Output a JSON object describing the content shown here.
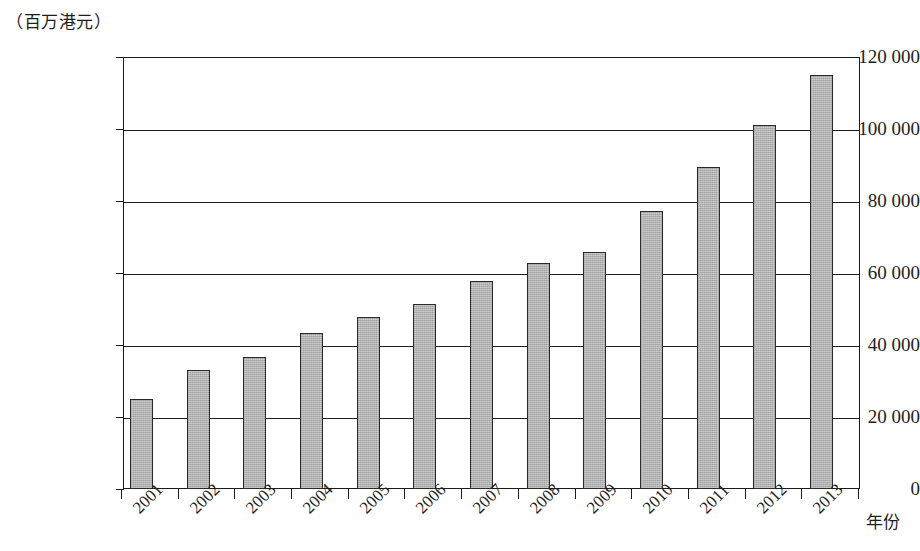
{
  "chart_data": {
    "type": "bar",
    "title": "",
    "subtitle": "",
    "unit_caption": "（百万港元）",
    "xlabel": "年份",
    "ylabel": "",
    "categories": [
      "2001",
      "2002",
      "2003",
      "2004",
      "2005",
      "2006",
      "2007",
      "2008",
      "2009",
      "2010",
      "2011",
      "2012",
      "2013"
    ],
    "values": [
      24900,
      33000,
      36600,
      43200,
      47700,
      51300,
      57900,
      62700,
      65800,
      77300,
      89400,
      101200,
      115000
    ],
    "ylim": [
      0,
      120000
    ],
    "ytick_values": [
      0,
      20000,
      40000,
      60000,
      80000,
      100000,
      120000
    ],
    "ytick_labels": [
      "0",
      "20 000",
      "40 000",
      "60 000",
      "80 000",
      "100 000",
      "120 000"
    ],
    "grid": true,
    "legend": null,
    "legend_position": "none",
    "series": [
      {
        "name": "",
        "values": [
          24900,
          33000,
          36600,
          43200,
          47700,
          51300,
          57900,
          62700,
          65800,
          77300,
          89400,
          101200,
          115000
        ],
        "color": "#a9a9a9"
      }
    ]
  },
  "colors": {
    "bar_fill": "#a9a9a9",
    "bar_border": "#2a2a2a",
    "axis": "#1b1b1b",
    "text": "#1d1d1d",
    "background": "#ffffff"
  }
}
